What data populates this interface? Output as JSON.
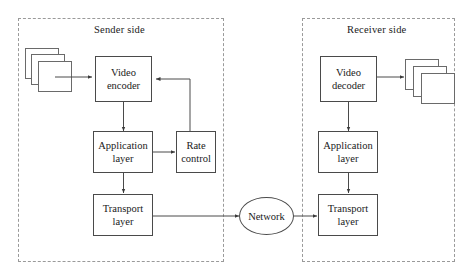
{
  "diagram": {
    "regions": [
      {
        "id": "sender",
        "label": "Sender side"
      },
      {
        "id": "receiver",
        "label": "Receiver side"
      }
    ],
    "nodes": [
      {
        "id": "video-encoder",
        "line1": "Video",
        "line2": "encoder"
      },
      {
        "id": "application-layer-sender",
        "line1": "Application",
        "line2": "layer"
      },
      {
        "id": "rate-control",
        "line1": "Rate",
        "line2": "control"
      },
      {
        "id": "transport-layer-sender",
        "line1": "Transport",
        "line2": "layer"
      },
      {
        "id": "network",
        "line1": "Network",
        "line2": ""
      },
      {
        "id": "video-decoder",
        "line1": "Video",
        "line2": "decoder"
      },
      {
        "id": "application-layer-receiver",
        "line1": "Application",
        "line2": "layer"
      },
      {
        "id": "transport-layer-receiver",
        "line1": "Transport",
        "line2": "layer"
      }
    ],
    "frame_stacks": [
      {
        "id": "input-video-frames",
        "count": 3
      },
      {
        "id": "output-video-frames",
        "count": 3
      }
    ],
    "edges": [
      {
        "from": "input-video-frames",
        "to": "video-encoder"
      },
      {
        "from": "video-encoder",
        "to": "application-layer-sender"
      },
      {
        "from": "application-layer-sender",
        "to": "rate-control"
      },
      {
        "from": "rate-control",
        "to": "video-encoder"
      },
      {
        "from": "application-layer-sender",
        "to": "transport-layer-sender"
      },
      {
        "from": "transport-layer-sender",
        "to": "network"
      },
      {
        "from": "network",
        "to": "transport-layer-receiver"
      },
      {
        "from": "transport-layer-receiver",
        "to": "application-layer-receiver"
      },
      {
        "from": "application-layer-receiver",
        "to": "video-decoder"
      },
      {
        "from": "video-decoder",
        "to": "output-video-frames"
      }
    ],
    "colors": {
      "stroke": "#4a4a4a",
      "region_border": "#9a9a9a",
      "text": "#1a1a1a",
      "background": "#ffffff"
    }
  }
}
